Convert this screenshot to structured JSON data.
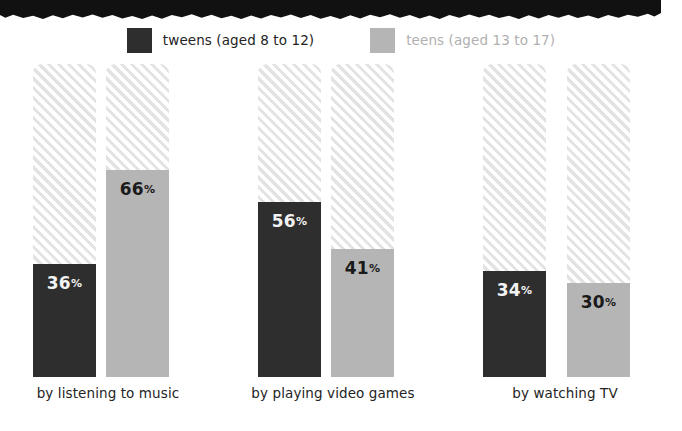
{
  "decoration": {
    "top_band_name": "torn-paper-black-band"
  },
  "legend": {
    "entries": [
      {
        "label": "tweens (aged 8 to 12)",
        "color": "#2e2e2e",
        "tone": "dark"
      },
      {
        "label": "teens (aged 13 to 17)",
        "color": "#b5b5b5",
        "tone": "light"
      }
    ]
  },
  "chart_data": {
    "type": "bar",
    "title": "",
    "subtitle": "",
    "xlabel": "",
    "ylabel": "",
    "ylim": [
      0,
      100
    ],
    "grid": false,
    "legend_position": "top-center",
    "value_suffix": "%",
    "categories": [
      "by listening to music",
      "by playing video games",
      "by watching TV"
    ],
    "series": [
      {
        "name": "tweens (aged 8 to 12)",
        "color": "#2e2e2e",
        "values": [
          36,
          56,
          34
        ],
        "labels": [
          "36",
          "56",
          "34"
        ]
      },
      {
        "name": "teens (aged 13 to 17)",
        "color": "#b5b5b5",
        "values": [
          66,
          41,
          30
        ],
        "labels": [
          "66",
          "41",
          "30"
        ]
      }
    ]
  },
  "colors": {
    "tweens": "#2e2e2e",
    "teens": "#b5b5b5",
    "hatch": "#e3e3e3",
    "background": "#ffffff",
    "band": "#111111"
  }
}
